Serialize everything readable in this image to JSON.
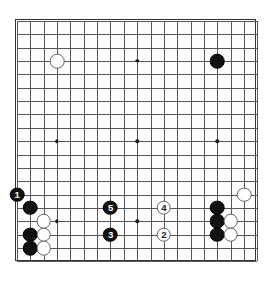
{
  "diagram": {
    "board_size": 19,
    "grid": {
      "origin_x": 16,
      "origin_y": 16,
      "spacing": 13.35,
      "show_grid": true
    },
    "star_points": [
      {
        "col": 4,
        "row": 4
      },
      {
        "col": 10,
        "row": 4
      },
      {
        "col": 16,
        "row": 4
      },
      {
        "col": 4,
        "row": 10
      },
      {
        "col": 10,
        "row": 10
      },
      {
        "col": 16,
        "row": 10
      },
      {
        "col": 4,
        "row": 16
      },
      {
        "col": 10,
        "row": 16
      },
      {
        "col": 16,
        "row": 16
      }
    ],
    "colors": {
      "black_stone": "#111111",
      "white_stone": "#ffffff",
      "white_stone_edge": "#666668",
      "grid_line": "#55555a",
      "board_border": "#333333",
      "board_background": "#fdfdfd",
      "black_label": "#ffffff",
      "white_label": "#1a1a1a"
    },
    "stones": [
      {
        "col": 4,
        "row": 4,
        "color": "white",
        "label": ""
      },
      {
        "col": 16,
        "row": 4,
        "color": "black",
        "label": ""
      },
      {
        "col": 1,
        "row": 14,
        "color": "black",
        "label": "1"
      },
      {
        "col": 2,
        "row": 15,
        "color": "black",
        "label": ""
      },
      {
        "col": 3,
        "row": 16,
        "color": "white",
        "label": ""
      },
      {
        "col": 2,
        "row": 17,
        "color": "black",
        "label": ""
      },
      {
        "col": 3,
        "row": 17,
        "color": "white",
        "label": ""
      },
      {
        "col": 2,
        "row": 18,
        "color": "black",
        "label": ""
      },
      {
        "col": 3,
        "row": 18,
        "color": "white",
        "label": ""
      },
      {
        "col": 8,
        "row": 15,
        "color": "black",
        "label": "5"
      },
      {
        "col": 8,
        "row": 17,
        "color": "black",
        "label": "3"
      },
      {
        "col": 12,
        "row": 15,
        "color": "white",
        "label": "4"
      },
      {
        "col": 12,
        "row": 17,
        "color": "white",
        "label": "2"
      },
      {
        "col": 18,
        "row": 14,
        "color": "white",
        "label": ""
      },
      {
        "col": 16,
        "row": 15,
        "color": "black",
        "label": ""
      },
      {
        "col": 16,
        "row": 16,
        "color": "black",
        "label": ""
      },
      {
        "col": 17,
        "row": 16,
        "color": "white",
        "label": ""
      },
      {
        "col": 16,
        "row": 17,
        "color": "black",
        "label": ""
      },
      {
        "col": 17,
        "row": 17,
        "color": "white",
        "label": ""
      }
    ],
    "move_sequence": [
      {
        "number": "1",
        "color": "black"
      },
      {
        "number": "2",
        "color": "white"
      },
      {
        "number": "3",
        "color": "black"
      },
      {
        "number": "4",
        "color": "white"
      },
      {
        "number": "5",
        "color": "black"
      }
    ]
  }
}
